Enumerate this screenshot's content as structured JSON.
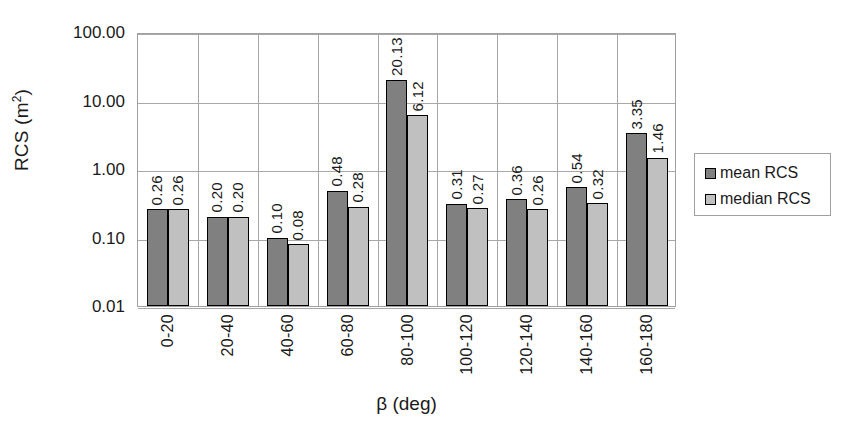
{
  "chart_data": {
    "type": "bar",
    "title": "",
    "xlabel": "β (deg)",
    "ylabel_text": "RCS (m",
    "ylabel_sup": "2",
    "ylabel_tail": ")",
    "ylabel_full": "RCS (m2)",
    "yscale": "log",
    "ylim": [
      0.01,
      100
    ],
    "ytick_labels": [
      "100.00",
      "10.00",
      "1.00",
      "0.10",
      "0.01"
    ],
    "ytick_values": [
      100,
      10,
      1,
      0.1,
      0.01
    ],
    "grid": true,
    "legend_position": "right-outside",
    "categories": [
      "0-20",
      "20-40",
      "40-60",
      "60-80",
      "80-100",
      "100-120",
      "120-140",
      "140-160",
      "160-180"
    ],
    "series": [
      {
        "name": "mean RCS",
        "color": "#808080",
        "values": [
          0.26,
          0.2,
          0.1,
          0.48,
          20.13,
          0.31,
          0.36,
          0.54,
          3.35
        ],
        "labels": [
          "0.26",
          "0.20",
          "0.10",
          "0.48",
          "20.13",
          "0.31",
          "0.36",
          "0.54",
          "3.35"
        ]
      },
      {
        "name": "median RCS",
        "color": "#c0c0c0",
        "values": [
          0.26,
          0.2,
          0.08,
          0.28,
          6.12,
          0.27,
          0.26,
          0.32,
          1.46
        ],
        "labels": [
          "0.26",
          "0.20",
          "0.08",
          "0.28",
          "6.12",
          "0.27",
          "0.26",
          "0.32",
          "1.46"
        ]
      }
    ]
  },
  "legend": {
    "items": [
      {
        "label": "mean RCS",
        "color": "#808080"
      },
      {
        "label": "median RCS",
        "color": "#c0c0c0"
      }
    ]
  }
}
